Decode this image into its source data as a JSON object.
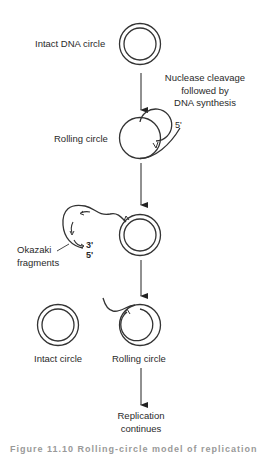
{
  "diagram": {
    "labels": {
      "intact_dna_circle": "Intact DNA circle",
      "nuclease_step": [
        "Nuclease cleavage",
        "followed by",
        "DNA synthesis"
      ],
      "rolling_circle_1": "Rolling circle",
      "five_prime_1": "5'",
      "okazaki": [
        "Okazaki",
        "fragments"
      ],
      "three_prime": "3'",
      "five_prime_2": "5'",
      "intact_circle": "Intact circle",
      "rolling_circle_2": "Rolling circle",
      "replication": [
        "Replication",
        "continues"
      ]
    },
    "caption": "Figure 11.10  Rolling-circle model of replication"
  }
}
